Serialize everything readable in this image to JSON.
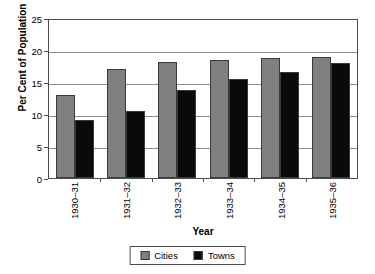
{
  "chart_data": {
    "type": "bar",
    "title": "",
    "xlabel": "Year",
    "ylabel": "Per Cent of Population",
    "categories": [
      "1930–31",
      "1931–32",
      "1932–33",
      "1933–34",
      "1934–35",
      "1935–36"
    ],
    "series": [
      {
        "name": "Cities",
        "color": "#808080",
        "values": [
          13.0,
          17.0,
          18.2,
          18.5,
          18.7,
          18.9
        ]
      },
      {
        "name": "Towns",
        "color": "#0a0a0a",
        "values": [
          9.0,
          10.5,
          13.8,
          15.4,
          16.5,
          18.0
        ]
      }
    ],
    "ylim": [
      0,
      25
    ],
    "yticks": [
      0,
      5,
      10,
      15,
      20,
      25
    ],
    "ytick_labels": [
      "0",
      "5",
      "10",
      "15",
      "20",
      "25"
    ],
    "grid": true,
    "legend_position": "bottom-center"
  }
}
